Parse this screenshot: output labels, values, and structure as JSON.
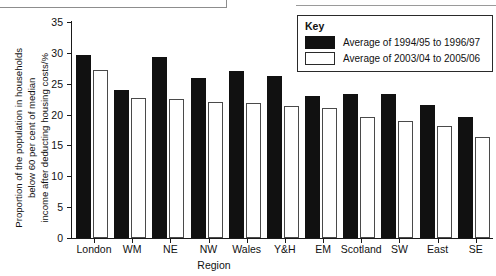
{
  "chart_data": {
    "type": "bar",
    "title": "",
    "xlabel": "Region",
    "ylabel": "Proportion of the population in households below 60 per cent of median income after deducting housing costs/%",
    "ylabel_lines": [
      "Proportion of the population in households",
      "below 60 per cent of median",
      "income after deducting housing costs/%"
    ],
    "ylim": [
      0,
      35
    ],
    "yticks": [
      0,
      5,
      10,
      15,
      20,
      25,
      30,
      35
    ],
    "ytick_labels": [
      "0",
      "5",
      "10",
      "15",
      "20",
      "25",
      "30",
      "35"
    ],
    "grid": false,
    "legend_position": "top-right",
    "categories": [
      "London",
      "WM",
      "NE",
      "NW",
      "Wales",
      "Y&H",
      "EM",
      "Scotland",
      "SW",
      "East",
      "SE"
    ],
    "series": [
      {
        "name": "Average of 1994/95 to 1996/97",
        "color": "#111111",
        "values": [
          29.6,
          24.0,
          29.4,
          25.9,
          27.0,
          26.3,
          23.0,
          23.3,
          23.3,
          21.5,
          19.6
        ]
      },
      {
        "name": "Average of 2003/04 to 2005/06",
        "color": "#ffffff",
        "values": [
          27.3,
          22.7,
          22.5,
          22.0,
          21.9,
          21.4,
          21.1,
          19.6,
          19.0,
          18.1,
          16.4
        ]
      }
    ]
  },
  "legend": {
    "title": "Key",
    "entries": [
      {
        "label": "Average of 1994/95 to 1996/97",
        "swatch": "dark"
      },
      {
        "label": "Average of 2003/04 to 2005/06",
        "swatch": "light"
      }
    ]
  },
  "colors": {
    "series_1": "#111111",
    "series_2": "#ffffff",
    "axis": "#1a1a1a",
    "background": "#ffffff"
  }
}
